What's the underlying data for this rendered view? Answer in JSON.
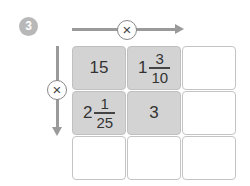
{
  "problem": {
    "number": "3",
    "badge_color": "#b8b8b8"
  },
  "operators": {
    "horizontal": {
      "symbol": "×",
      "direction": "right"
    },
    "vertical": {
      "symbol": "×",
      "direction": "down"
    }
  },
  "grid": {
    "filled_color": "#d3d3d3",
    "empty_color": "#ffffff",
    "rows": [
      [
        {
          "type": "whole",
          "value": "15",
          "filled": true
        },
        {
          "type": "mixed",
          "whole": "1",
          "numerator": "3",
          "denominator": "10",
          "filled": true
        },
        {
          "type": "empty",
          "filled": false
        }
      ],
      [
        {
          "type": "mixed",
          "whole": "2",
          "numerator": "1",
          "denominator": "25",
          "filled": true
        },
        {
          "type": "whole",
          "value": "3",
          "filled": true
        },
        {
          "type": "empty",
          "filled": false
        }
      ],
      [
        {
          "type": "empty",
          "filled": false
        },
        {
          "type": "empty",
          "filled": false
        },
        {
          "type": "empty",
          "filled": false
        }
      ]
    ]
  }
}
